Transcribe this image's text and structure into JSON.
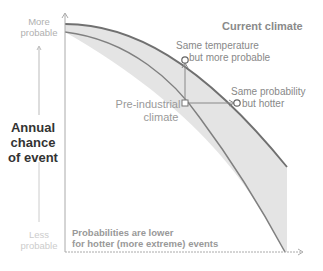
{
  "diagram": {
    "y_axis": {
      "top_label_line1": "More",
      "top_label_line2": "probable",
      "title_line1": "Annual",
      "title_line2": "chance",
      "title_line3": "of event",
      "bottom_label_line1": "Less",
      "bottom_label_line2": "probable"
    },
    "curves": {
      "current": "Current climate",
      "preindustrial_line1": "Pre-industrial",
      "preindustrial_line2": "climate"
    },
    "annotations": {
      "same_temp_line1": "Same temperature",
      "same_temp_line2": "but more probable",
      "same_prob_line1": "Same probability",
      "same_prob_line2": "but hotter"
    },
    "note_line1": "Probabilities are lower",
    "note_line2": "for hotter (more extreme) events",
    "colors": {
      "band_fill": "#e4e4e4",
      "curve_stroke": "#707070",
      "axis": "#aaaaaa",
      "marker_stroke": "#777777"
    }
  }
}
